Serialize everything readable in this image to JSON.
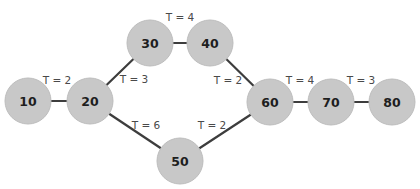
{
  "diagram": {
    "colors": {
      "background": "#ffffff",
      "node_fill": "#c8c8c8",
      "node_stroke": "#bdbdbd",
      "edge": "#3d3d3d",
      "node_text": "#1e1e1e",
      "edge_text": "#4a4a4a"
    },
    "node_radius": 23,
    "nodes": [
      {
        "id": "10",
        "label": "10",
        "x": 28,
        "y": 101
      },
      {
        "id": "20",
        "label": "20",
        "x": 90,
        "y": 101
      },
      {
        "id": "30",
        "label": "30",
        "x": 150,
        "y": 43
      },
      {
        "id": "40",
        "label": "40",
        "x": 210,
        "y": 43
      },
      {
        "id": "50",
        "label": "50",
        "x": 180,
        "y": 161
      },
      {
        "id": "60",
        "label": "60",
        "x": 270,
        "y": 102
      },
      {
        "id": "70",
        "label": "70",
        "x": 331,
        "y": 102
      },
      {
        "id": "80",
        "label": "80",
        "x": 392,
        "y": 102
      }
    ],
    "edges": [
      {
        "from": "10",
        "to": "20",
        "label": "T = 2",
        "lx": 57,
        "ly": 80
      },
      {
        "from": "20",
        "to": "30",
        "label": "T = 3",
        "lx": 134,
        "ly": 79
      },
      {
        "from": "30",
        "to": "40",
        "label": "T = 4",
        "lx": 180,
        "ly": 17
      },
      {
        "from": "40",
        "to": "60",
        "label": "T = 2",
        "lx": 228,
        "ly": 80
      },
      {
        "from": "20",
        "to": "50",
        "label": "T = 6",
        "lx": 146,
        "ly": 125
      },
      {
        "from": "50",
        "to": "60",
        "label": "T = 2",
        "lx": 212,
        "ly": 125
      },
      {
        "from": "60",
        "to": "70",
        "label": "T = 4",
        "lx": 300,
        "ly": 80
      },
      {
        "from": "70",
        "to": "80",
        "label": "T = 3",
        "lx": 361,
        "ly": 80
      }
    ]
  }
}
